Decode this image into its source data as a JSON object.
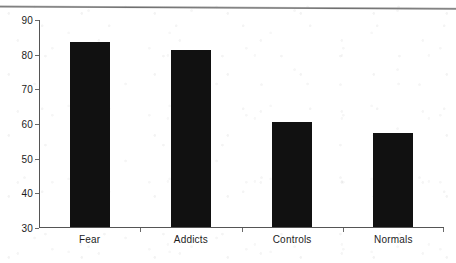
{
  "chart_data": {
    "type": "bar",
    "title": "",
    "subtitle": "",
    "xlabel": "",
    "ylabel": "",
    "categories": [
      "Fear",
      "Addicts",
      "Controls",
      "Normals"
    ],
    "values": [
      83.3,
      81.0,
      60.3,
      57.0
    ],
    "series": [
      {
        "name": "",
        "values": [
          83.3,
          81.0,
          60.3,
          57.0
        ]
      }
    ],
    "ylim": [
      30,
      90
    ],
    "yticks": [
      30,
      40,
      50,
      60,
      70,
      80,
      90
    ],
    "ytick_labels": [
      "30",
      "40",
      "50",
      "60",
      "70",
      "80",
      "90"
    ],
    "grid": false,
    "legend": false,
    "legend_position": "none",
    "bar_color": "#111111",
    "axis_color": "#555555",
    "background_color": "#ffffff",
    "annotations": []
  }
}
